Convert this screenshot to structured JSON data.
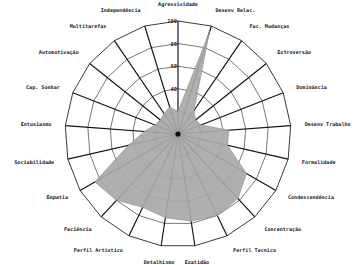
{
  "chart_data": {
    "type": "radar",
    "title": "",
    "subtitle": "",
    "xlabel": "",
    "ylabel": "",
    "grid": true,
    "legend": false,
    "legend_position": "none",
    "rlim": [
      0,
      100
    ],
    "tick_labels": [
      "40",
      "60",
      "80",
      "100"
    ],
    "tick_values": [
      40,
      60,
      80,
      100
    ],
    "categories": [
      "Agressividade",
      "Desenv Relac.",
      "Fac. Mudanças",
      "Extroversão",
      "Dominância",
      "Desenv Trabalho",
      "Formalidade",
      "Condescendência",
      "Concentração",
      "Perfil Tecnico",
      "Exatidão",
      "Detalhismo",
      "Perfil Artistico",
      "Paciência",
      "Empatia",
      "Sociabilidade",
      "Entusiasmo",
      "Cap. Sonhar",
      "Automotivação",
      "Multitarefas",
      "Independência"
    ],
    "series": [
      {
        "name": "Perfil",
        "color": "#a8a8a8",
        "values": [
          20,
          95,
          25,
          20,
          22,
          45,
          45,
          70,
          78,
          80,
          78,
          75,
          72,
          80,
          85,
          45,
          30,
          22,
          20,
          22,
          25
        ]
      }
    ]
  },
  "axis_labels": {
    "agressividade": "Agressividade",
    "desenv_relac": "Desenv Relac.",
    "fac_mudancas": "Fac. Mudanças",
    "extroversao": "Extroversão",
    "dominancia": "Dominância",
    "desenv_trabalho": "Desenv Trabalho",
    "formalidade": "Formalidade",
    "condescendencia": "Condescendência",
    "concentracao": "Concentração",
    "perfil_tecnico": "Perfil Tecnico",
    "exatidao": "Exatidão",
    "detalhismo": "Detalhismo",
    "perfil_artistico": "Perfil Artistico",
    "paciencia": "Paciência",
    "empatia": "Empatia",
    "sociabilidade": "Sociabilidade",
    "entusiasmo": "Entusiasmo",
    "cap_sonhar": "Cap. Sonhar",
    "automotivacao": "Automotivação",
    "multitarefas": "Multitarefas",
    "independencia": "Independência"
  },
  "ticks": {
    "t100": "100",
    "t80": "80",
    "t60": "60",
    "t40": "40"
  },
  "colors": {
    "series_fill": "#a8a8a8",
    "grid": "#4a4a4a",
    "spoke": "#111111",
    "text": "#1a1a1a",
    "background": "#ffffff"
  }
}
